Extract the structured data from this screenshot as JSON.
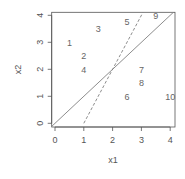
{
  "chart_data": {
    "type": "scatter",
    "title": "",
    "xlabel": "x1",
    "ylabel": "x2",
    "xlim": [
      -0.15,
      4.2
    ],
    "ylim": [
      -0.15,
      4.2
    ],
    "x_ticks": [
      "0",
      "1",
      "2",
      "3",
      "4"
    ],
    "y_ticks": [
      "0",
      "1",
      "2",
      "3",
      "4"
    ],
    "grid": false,
    "legend": null,
    "points": [
      {
        "label": "1",
        "x": 0.5,
        "y": 3.0
      },
      {
        "label": "2",
        "x": 1.0,
        "y": 2.5
      },
      {
        "label": "3",
        "x": 1.5,
        "y": 3.5
      },
      {
        "label": "4",
        "x": 1.0,
        "y": 2.0
      },
      {
        "label": "5",
        "x": 2.5,
        "y": 3.75
      },
      {
        "label": "6",
        "x": 2.5,
        "y": 1.0
      },
      {
        "label": "7",
        "x": 3.0,
        "y": 2.0
      },
      {
        "label": "8",
        "x": 3.0,
        "y": 1.5
      },
      {
        "label": "9",
        "x": 3.5,
        "y": 4.0
      },
      {
        "label": "10",
        "x": 4.0,
        "y": 1.0
      }
    ],
    "lines": [
      {
        "name": "solid line y = x",
        "style": "solid",
        "x": [
          -0.15,
          4.2
        ],
        "y": [
          -0.15,
          4.2
        ]
      },
      {
        "name": "dashed line y = 2x - 2",
        "style": "dashed",
        "x": [
          1.0,
          3.1
        ],
        "y": [
          0.0,
          4.2
        ]
      }
    ],
    "colors": {
      "points": "#666666",
      "lines": "#808080",
      "axes": "#555555"
    }
  }
}
